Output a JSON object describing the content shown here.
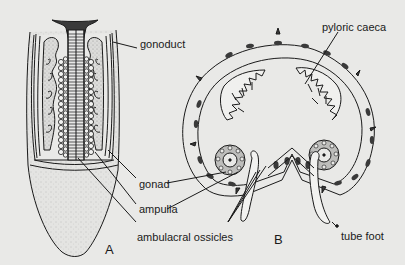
{
  "figure": {
    "panels": [
      {
        "id": "A",
        "label": "A"
      },
      {
        "id": "B",
        "label": "B"
      }
    ],
    "labels": {
      "gonoduct": "gonoduct",
      "pyloric_caeca": "pyloric caeca",
      "gonad": "gonad",
      "ampulla": "ampulla",
      "ambulacral_ossicles": "ambulacral ossicles",
      "tube_foot": "tube foot"
    }
  },
  "colors": {
    "background": "#e9e9e7",
    "ink": "#1a1a1a",
    "stipple": "#bdbdbb",
    "dark_fill": "#3a3a3a"
  }
}
